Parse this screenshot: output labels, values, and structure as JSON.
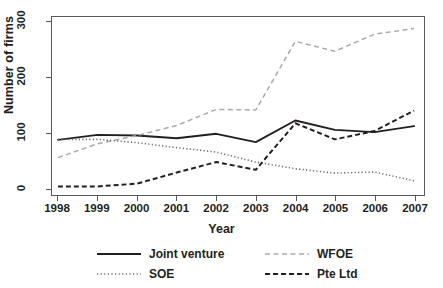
{
  "chart_data": {
    "type": "line",
    "title": "",
    "xlabel": "Year",
    "ylabel": "Number of firms",
    "categories": [
      "1998",
      "1999",
      "2000",
      "2001",
      "2002",
      "2003",
      "2004",
      "2005",
      "2006",
      "2007"
    ],
    "x": [
      1998,
      1999,
      2000,
      2001,
      2002,
      2003,
      2004,
      2005,
      2006,
      2007
    ],
    "xlim": [
      1998,
      2007
    ],
    "ylim": [
      0,
      300
    ],
    "yticks": [
      0,
      100,
      200,
      300
    ],
    "ytick_labels": [
      "0",
      "100",
      "200",
      "300"
    ],
    "xticks": [
      1998,
      1999,
      2000,
      2001,
      2002,
      2003,
      2004,
      2005,
      2006,
      2007
    ],
    "grid": false,
    "legend_position": "bottom",
    "series": [
      {
        "name": "Joint venture",
        "style": "solid",
        "color": "#231f20",
        "values": [
          87,
          96,
          95,
          90,
          98,
          83,
          122,
          105,
          101,
          112
        ]
      },
      {
        "name": "WFOE",
        "style": "dashed-light",
        "color": "#a7a9ac",
        "values": [
          55,
          80,
          95,
          113,
          142,
          141,
          265,
          247,
          278,
          288
        ]
      },
      {
        "name": "SOE",
        "style": "dotted",
        "color": "#6d6e71",
        "values": [
          88,
          88,
          82,
          73,
          65,
          47,
          35,
          27,
          29,
          13
        ]
      },
      {
        "name": "Pte Ltd",
        "style": "dashed-dark",
        "color": "#231f20",
        "values": [
          3,
          3,
          8,
          28,
          47,
          33,
          117,
          88,
          103,
          140
        ]
      }
    ]
  },
  "axes": {
    "y_label": "Number of firms",
    "x_label": "Year"
  },
  "legend": {
    "items": [
      {
        "label": "Joint venture"
      },
      {
        "label": "SOE"
      },
      {
        "label": "WFOE"
      },
      {
        "label": "Pte Ltd"
      }
    ]
  }
}
